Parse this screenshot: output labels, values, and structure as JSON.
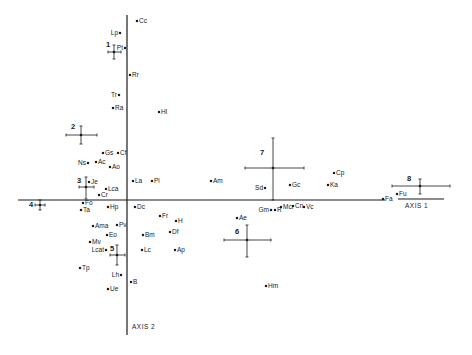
{
  "chart_data": {
    "type": "scatter",
    "title": "",
    "xlabel": "AXIS 1",
    "ylabel": "AXIS 2",
    "grid": false,
    "legend": null,
    "origin_px": [
      127,
      200
    ],
    "note": "Ordination plot (two axes); points are species codes, numbered crosses are group centroids with error bars. Coordinates given in screenshot pixel space (x right, y down).",
    "points": [
      {
        "label": "Cc",
        "x": 137,
        "y": 21,
        "label_side": "right"
      },
      {
        "label": "Lp",
        "x": 120,
        "y": 33,
        "label_side": "left"
      },
      {
        "label": "Pt",
        "x": 125,
        "y": 48,
        "label_side": "left"
      },
      {
        "label": "Rr",
        "x": 130,
        "y": 75,
        "label_side": "right"
      },
      {
        "label": "Tr",
        "x": 119,
        "y": 95,
        "label_side": "left"
      },
      {
        "label": "Ra",
        "x": 113,
        "y": 108,
        "label_side": "right"
      },
      {
        "label": "Hl",
        "x": 159,
        "y": 112,
        "label_side": "right"
      },
      {
        "label": "Gs",
        "x": 103,
        "y": 153,
        "label_side": "right"
      },
      {
        "label": "Cf",
        "x": 118,
        "y": 153,
        "label_side": "right"
      },
      {
        "label": "Ns",
        "x": 88,
        "y": 163,
        "label_side": "left"
      },
      {
        "label": "Ac",
        "x": 96,
        "y": 162,
        "label_side": "right"
      },
      {
        "label": "Ao",
        "x": 110,
        "y": 167,
        "label_side": "right"
      },
      {
        "label": "Je",
        "x": 89,
        "y": 182,
        "label_side": "right"
      },
      {
        "label": "Lca",
        "x": 106,
        "y": 189,
        "label_side": "right"
      },
      {
        "label": "Cr",
        "x": 99,
        "y": 195,
        "label_side": "right"
      },
      {
        "label": "La",
        "x": 133,
        "y": 181,
        "label_side": "right"
      },
      {
        "label": "Pl",
        "x": 152,
        "y": 181,
        "label_side": "right"
      },
      {
        "label": "Am",
        "x": 211,
        "y": 181,
        "label_side": "right"
      },
      {
        "label": "Fo",
        "x": 83,
        "y": 203,
        "label_side": "right"
      },
      {
        "label": "Ta",
        "x": 81,
        "y": 210,
        "label_side": "right"
      },
      {
        "label": "Hp",
        "x": 108,
        "y": 207,
        "label_side": "right"
      },
      {
        "label": "Dc",
        "x": 135,
        "y": 207,
        "label_side": "right"
      },
      {
        "label": "Fr",
        "x": 160,
        "y": 216,
        "label_side": "right"
      },
      {
        "label": "H",
        "x": 176,
        "y": 221,
        "label_side": "right"
      },
      {
        "label": "Df",
        "x": 170,
        "y": 232,
        "label_side": "right"
      },
      {
        "label": "Bm",
        "x": 143,
        "y": 235,
        "label_side": "right"
      },
      {
        "label": "Lc",
        "x": 142,
        "y": 250,
        "label_side": "right"
      },
      {
        "label": "Ap",
        "x": 175,
        "y": 250,
        "label_side": "right"
      },
      {
        "label": "Ama",
        "x": 93,
        "y": 226,
        "label_side": "right"
      },
      {
        "label": "Pv",
        "x": 117,
        "y": 225,
        "label_side": "right"
      },
      {
        "label": "Eo",
        "x": 107,
        "y": 235,
        "label_side": "right"
      },
      {
        "label": "Mv",
        "x": 90,
        "y": 242,
        "label_side": "right"
      },
      {
        "label": "Lcat",
        "x": 106,
        "y": 250,
        "label_side": "left"
      },
      {
        "label": "Tp",
        "x": 80,
        "y": 268,
        "label_side": "right"
      },
      {
        "label": "Lh",
        "x": 121,
        "y": 275,
        "label_side": "left"
      },
      {
        "label": "B",
        "x": 131,
        "y": 282,
        "label_side": "right"
      },
      {
        "label": "Ue",
        "x": 108,
        "y": 289,
        "label_side": "right"
      },
      {
        "label": "Sd",
        "x": 265,
        "y": 188,
        "label_side": "left"
      },
      {
        "label": "Gc",
        "x": 290,
        "y": 185,
        "label_side": "right"
      },
      {
        "label": "Cp",
        "x": 334,
        "y": 173,
        "label_side": "right"
      },
      {
        "label": "Ka",
        "x": 328,
        "y": 185,
        "label_side": "right"
      },
      {
        "label": "Fa",
        "x": 383,
        "y": 199,
        "label_side": "right"
      },
      {
        "label": "Fu",
        "x": 397,
        "y": 194,
        "label_side": "right"
      },
      {
        "label": "Gm",
        "x": 271,
        "y": 210,
        "label_side": "left"
      },
      {
        "label": "R",
        "x": 275,
        "y": 210,
        "label_side": "right"
      },
      {
        "label": "Mcr",
        "x": 281,
        "y": 207,
        "label_side": "right"
      },
      {
        "label": "Cn",
        "x": 293,
        "y": 206,
        "label_side": "right"
      },
      {
        "label": "Vc",
        "x": 304,
        "y": 207,
        "label_side": "right"
      },
      {
        "label": "Ae",
        "x": 237,
        "y": 218,
        "label_side": "right"
      },
      {
        "label": "Hm",
        "x": 266,
        "y": 286,
        "label_side": "right"
      }
    ],
    "group_centroids": [
      {
        "label": "1",
        "x": 114,
        "y": 52,
        "xerr": [
          108,
          121
        ],
        "yerr": [
          45,
          59
        ],
        "label_pos": [
          106,
          47
        ]
      },
      {
        "label": "2",
        "x": 81,
        "y": 135,
        "xerr": [
          66,
          97
        ],
        "yerr": [
          126,
          144
        ],
        "label_pos": [
          71,
          129
        ]
      },
      {
        "label": "3",
        "x": 86,
        "y": 187,
        "xerr": [
          79,
          94
        ],
        "yerr": [
          177,
          199
        ],
        "label_pos": [
          77,
          183
        ]
      },
      {
        "label": "4",
        "x": 40,
        "y": 205,
        "xerr": [
          35,
          45
        ],
        "yerr": [
          200,
          210
        ],
        "label_pos": [
          29,
          207
        ]
      },
      {
        "label": "5",
        "x": 117,
        "y": 255,
        "xerr": [
          110,
          125
        ],
        "yerr": [
          245,
          265
        ],
        "label_pos": [
          110,
          251
        ]
      },
      {
        "label": "6",
        "x": 247,
        "y": 240,
        "xerr": [
          224,
          271
        ],
        "yerr": [
          225,
          257
        ],
        "label_pos": [
          235,
          234
        ]
      },
      {
        "label": "7",
        "x": 273,
        "y": 168,
        "xerr": [
          245,
          304
        ],
        "yerr": [
          138,
          200
        ],
        "label_pos": [
          260,
          155
        ]
      },
      {
        "label": "8",
        "x": 420,
        "y": 186,
        "xerr": [
          392,
          450
        ],
        "yerr": [
          179,
          194
        ],
        "label_pos": [
          407,
          181
        ]
      }
    ]
  },
  "axes": {
    "axis1_label": "AXIS 1",
    "axis2_label": "AXIS 2"
  }
}
